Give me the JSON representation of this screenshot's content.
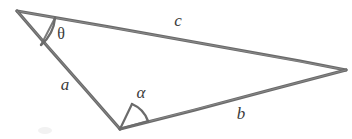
{
  "figure": {
    "width": 352,
    "height": 139,
    "background_color": "#ffffff",
    "stroke_color": "#6b6b6b",
    "stroke_color_light": "#8d8d8d",
    "label_color": "#3b3b3b",
    "stroke_width": 3
  },
  "vertices": [
    {
      "id": "A",
      "x": 17,
      "y": 11,
      "name": "apex-top-left"
    },
    {
      "id": "B",
      "x": 120,
      "y": 129,
      "name": "vertex-bottom"
    },
    {
      "id": "C",
      "x": 346,
      "y": 70,
      "name": "vertex-right"
    }
  ],
  "sides": [
    {
      "id": "c",
      "label": "c",
      "from": "A",
      "to": "C",
      "label_x": 178,
      "label_y": 20,
      "name": "side-c"
    },
    {
      "id": "a",
      "label": "a",
      "from": "A",
      "to": "B",
      "label_x": 65,
      "label_y": 84,
      "name": "side-a"
    },
    {
      "id": "b",
      "label": "b",
      "from": "B",
      "to": "C",
      "label_x": 241,
      "label_y": 113,
      "name": "side-b"
    }
  ],
  "angles": [
    {
      "id": "theta",
      "label": "θ",
      "at_vertex": "A",
      "between_sides": [
        "c",
        "a"
      ],
      "label_x": 61,
      "label_y": 34,
      "name": "angle-theta"
    },
    {
      "id": "alpha",
      "label": "α",
      "at_vertex": "B",
      "between_sides": [
        "a",
        "b"
      ],
      "label_x": 141,
      "label_y": 92,
      "name": "angle-alpha"
    }
  ]
}
